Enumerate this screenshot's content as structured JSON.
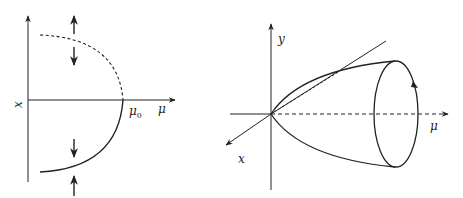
{
  "figure": {
    "left_panel": {
      "description": "Saddle-node bifurcation diagram: stable branch solid, unstable branch dashed",
      "vertical_axis_label": "x",
      "horizontal_axis_label": "μ",
      "critical_point_label": "μ",
      "critical_point_subscript": "0",
      "stable_branch": "solid",
      "unstable_branch": "dashed",
      "arrows": [
        "up",
        "down",
        "down",
        "up"
      ]
    },
    "right_panel": {
      "description": "Hopf bifurcation paraboloid with limit cycle",
      "vertical_axis_label": "y",
      "depth_axis_label": "x",
      "horizontal_axis_label": "μ",
      "limit_cycle_direction": "counterclockwise"
    },
    "colors": {
      "stroke": "#222222",
      "background": "#ffffff"
    }
  }
}
